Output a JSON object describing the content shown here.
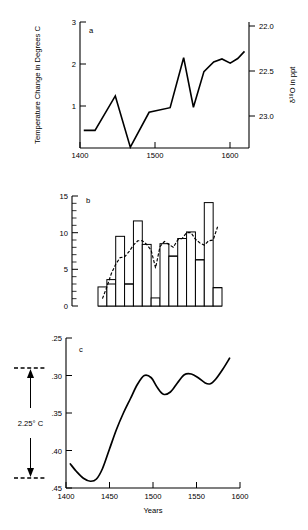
{
  "figure": {
    "panels": [
      "a",
      "b",
      "c"
    ],
    "xlabel": "Years"
  },
  "panel_a": {
    "letter": "a",
    "ylabel_left": "Temperature Change in Degrees C",
    "ylabel_right": "δ¹⁸O in ppt",
    "yticks_left": [
      "1",
      "2",
      "3"
    ],
    "yticks_right": [
      "22.0",
      "22.5",
      "23.0"
    ],
    "xticks": [
      "1400",
      "1500",
      "1600"
    ]
  },
  "panel_b": {
    "letter": "b",
    "yticks": [
      "0",
      "5",
      "10",
      "15"
    ]
  },
  "panel_c": {
    "letter": "c",
    "yticks": [
      ".25",
      ".30",
      ".35",
      ".40",
      ".45"
    ],
    "xticks": [
      "1400",
      "1450",
      "1500",
      "1550",
      "1600"
    ],
    "range_annotation": "2.25° C",
    "xlabel": "Years"
  },
  "chart_data": [
    {
      "type": "line",
      "panel": "a",
      "title": "",
      "xlabel": "",
      "ylabel": "Temperature Change in Degrees C",
      "ylabel_secondary": "δ¹⁸O in ppt",
      "xlim": [
        1400,
        1625
      ],
      "ylim": [
        0,
        3
      ],
      "ylim_secondary": [
        23.3,
        21.9
      ],
      "yticks": [
        1,
        2,
        3
      ],
      "yticks_secondary": [
        22.0,
        22.5,
        23.0
      ],
      "xticks": [
        1400,
        1500,
        1600
      ],
      "grid": false,
      "legend": "none",
      "x": [
        1405,
        1420,
        1447,
        1467,
        1492,
        1520,
        1538,
        1551,
        1565,
        1578,
        1589,
        1600,
        1610,
        1619
      ],
      "values": [
        0.42,
        0.42,
        1.24,
        0.02,
        0.85,
        0.96,
        2.15,
        0.97,
        1.82,
        2.05,
        2.12,
        2.02,
        2.13,
        2.3
      ]
    },
    {
      "type": "bar",
      "panel": "b",
      "title": "",
      "xlabel": "",
      "ylabel": "",
      "ylim": [
        0,
        15
      ],
      "yticks": [
        0,
        5,
        10,
        15
      ],
      "grid": false,
      "legend": "none",
      "categories": [
        "1",
        "2",
        "3",
        "4",
        "5",
        "6",
        "7",
        "8",
        "9",
        "10",
        "11",
        "12",
        "13",
        "14"
      ],
      "values": [
        2.6,
        3.6,
        9.5,
        3.0,
        11.6,
        8.4,
        1.1,
        8.5,
        6.8,
        9.2,
        10.1,
        6.3,
        14.1,
        2.5
      ],
      "overlay_series": {
        "name": "smoothed-average",
        "style": "dashed",
        "x": [
          1,
          1.5,
          2,
          2.5,
          3,
          3.5,
          4,
          4.5,
          5,
          5.5,
          6,
          6.5,
          7,
          7.5,
          8,
          8.5,
          9,
          9.5,
          10,
          10.5,
          11,
          11.5,
          12,
          12.5,
          13,
          13.5,
          14
        ],
        "values": [
          1.0,
          2.6,
          4.4,
          5.7,
          6.6,
          6.7,
          7.4,
          8.3,
          8.9,
          8.9,
          8.4,
          7.6,
          5.2,
          8.1,
          8.8,
          8.4,
          8.0,
          9.0,
          9.2,
          10.0,
          10.0,
          9.1,
          8.6,
          8.3,
          8.9,
          9.0,
          10.8
        ]
      }
    },
    {
      "type": "line",
      "panel": "c",
      "title": "",
      "xlabel": "Years",
      "ylabel": "",
      "xlim": [
        1400,
        1600
      ],
      "ylim": [
        0.45,
        0.25
      ],
      "yticks": [
        0.25,
        0.3,
        0.35,
        0.4,
        0.45
      ],
      "xticks": [
        1400,
        1450,
        1500,
        1550,
        1600
      ],
      "grid": false,
      "legend": "none",
      "annotation": "2.25° C spans from .30 to .44",
      "x": [
        1405,
        1412,
        1420,
        1428,
        1435,
        1442,
        1450,
        1458,
        1466,
        1474,
        1482,
        1490,
        1498,
        1505,
        1512,
        1520,
        1528,
        1536,
        1544,
        1552,
        1560,
        1566,
        1572,
        1580,
        1588
      ],
      "values": [
        0.418,
        0.428,
        0.437,
        0.441,
        0.438,
        0.424,
        0.398,
        0.372,
        0.35,
        0.331,
        0.312,
        0.3,
        0.303,
        0.316,
        0.325,
        0.322,
        0.31,
        0.299,
        0.298,
        0.303,
        0.31,
        0.311,
        0.305,
        0.292,
        0.277
      ]
    }
  ]
}
